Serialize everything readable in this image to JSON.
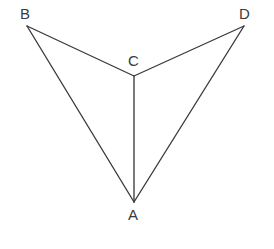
{
  "figure": {
    "background_color": "#ffffff",
    "stroke_color": "#3a3a3a",
    "stroke_width": 1.35,
    "canvas": {
      "width": 274,
      "height": 249
    },
    "vertices": [
      {
        "id": "B",
        "label": "B",
        "x": 27,
        "y": 26,
        "label_x": 20,
        "label_y": 6
      },
      {
        "id": "D",
        "label": "D",
        "x": 244,
        "y": 26,
        "label_x": 239,
        "label_y": 6
      },
      {
        "id": "C",
        "label": "C",
        "x": 134,
        "y": 76,
        "label_x": 128,
        "label_y": 53
      },
      {
        "id": "A",
        "label": "A",
        "x": 134,
        "y": 202,
        "label_x": 128,
        "label_y": 207
      }
    ],
    "edges": [
      {
        "id": "BC",
        "from": "B",
        "to": "C",
        "path": "M 27 26 L 134 76"
      },
      {
        "id": "CD",
        "from": "C",
        "to": "D",
        "path": "M 134 76 L 244 26"
      },
      {
        "id": "BA",
        "from": "B",
        "to": "A",
        "path": "M 27 26 L 134 202"
      },
      {
        "id": "DA",
        "from": "D",
        "to": "A",
        "path": "M 244 26 L 134 202"
      },
      {
        "id": "CA",
        "from": "C",
        "to": "A",
        "path": "M 134 76 L 134 202"
      }
    ]
  }
}
